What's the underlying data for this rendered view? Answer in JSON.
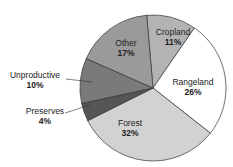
{
  "chart_data": {
    "type": "pie",
    "title": "",
    "slices": [
      {
        "label": "Cropland",
        "value": 11,
        "display": "11%",
        "color": "#b3b3b3"
      },
      {
        "label": "Rangeland",
        "value": 26,
        "display": "26%",
        "color": "#ffffff"
      },
      {
        "label": "Forest",
        "value": 32,
        "display": "32%",
        "color": "#d2d2d2"
      },
      {
        "label": "Preserves",
        "value": 4,
        "display": "4%",
        "color": "#555555"
      },
      {
        "label": "Unproductive",
        "value": 10,
        "display": "10%",
        "color": "#7a7a7a"
      },
      {
        "label": "Other",
        "value": 17,
        "display": "17%",
        "color": "#9a9a9a"
      }
    ],
    "start_angle_deg": -5,
    "direction": "clockwise",
    "legend": "none (inline labels)"
  },
  "labels": {
    "cropland": {
      "name": "Cropland",
      "pct": "11%"
    },
    "rangeland": {
      "name": "Rangeland",
      "pct": "26%"
    },
    "forest": {
      "name": "Forest",
      "pct": "32%"
    },
    "preserves": {
      "name": "Preserves",
      "pct": "4%"
    },
    "unproductive": {
      "name": "Unproductive",
      "pct": "10%"
    },
    "other": {
      "name": "Other",
      "pct": "17%"
    }
  }
}
